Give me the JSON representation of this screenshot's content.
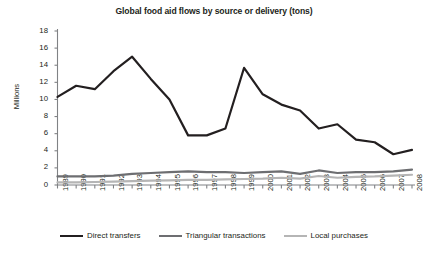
{
  "chart_data": {
    "type": "line",
    "title": "Global food aid flows by source or delivery (tons)",
    "xlabel": "",
    "ylabel": "Millions",
    "ylim": [
      0,
      18
    ],
    "ytick_step": 2,
    "grid": false,
    "legend_position": "bottom",
    "categories": [
      "1989",
      "1990",
      "1991",
      "1992",
      "1993",
      "1994",
      "1995",
      "1996",
      "1997",
      "1998",
      "1999",
      "2000",
      "2001",
      "2002",
      "2003",
      "2004",
      "2005",
      "2006",
      "2007",
      "2008"
    ],
    "ytick_labels": [
      "0",
      "2",
      "4",
      "6",
      "8",
      "10",
      "12",
      "14",
      "16",
      "18"
    ],
    "series": [
      {
        "name": "Direct transfers",
        "color": "#231f20",
        "width": 2.2,
        "values": [
          10.3,
          11.6,
          11.2,
          13.3,
          15.0,
          12.4,
          10.0,
          5.8,
          5.8,
          6.6,
          13.7,
          10.6,
          9.4,
          8.7,
          6.6,
          7.1,
          5.3,
          5.0,
          3.6,
          4.1
        ]
      },
      {
        "name": "Triangular transactions",
        "color": "#6d6e71",
        "width": 2.2,
        "values": [
          1.0,
          1.0,
          1.0,
          1.1,
          1.3,
          1.4,
          1.5,
          1.6,
          1.5,
          1.5,
          1.4,
          1.5,
          1.6,
          1.3,
          1.7,
          1.4,
          1.5,
          1.5,
          1.6,
          1.8
        ]
      },
      {
        "name": "Local purchases",
        "color": "#b5b5b5",
        "width": 2.2,
        "values": [
          0.3,
          0.3,
          0.35,
          0.4,
          0.45,
          0.5,
          0.55,
          0.6,
          0.6,
          0.65,
          0.7,
          0.75,
          0.85,
          0.75,
          1.05,
          0.85,
          0.95,
          1.0,
          1.1,
          1.2
        ]
      }
    ]
  },
  "axis": {
    "axis_color": "#808285"
  }
}
